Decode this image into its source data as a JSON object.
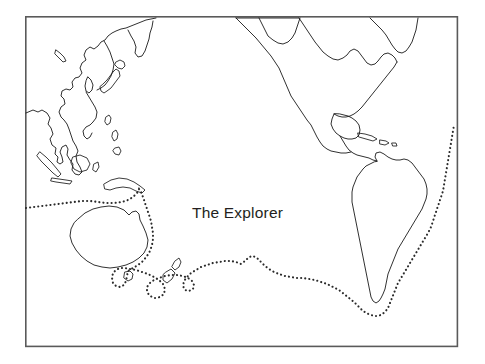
{
  "figure": {
    "name": "pacific-world-map-outline",
    "title": "The Explorer",
    "title_position": {
      "x": 192,
      "y": 218
    },
    "background_color": "#ffffff",
    "border_color": "#5a5a5a",
    "coastline_color": "#1a1a1a",
    "route_color": "#2b2b2b",
    "frame": {
      "x": 25,
      "y": 16,
      "width": 433,
      "height": 331
    },
    "canvas": {
      "width": 485,
      "height": 364
    }
  },
  "map": {
    "projection_note": "Pacific-centred world outline",
    "landmasses": [
      {
        "name": "north-america",
        "label": "North America"
      },
      {
        "name": "south-america",
        "label": "South America"
      },
      {
        "name": "asia-east",
        "label": "East Asia"
      },
      {
        "name": "japan",
        "label": "Japan"
      },
      {
        "name": "kamchatka",
        "label": "Kamchatka"
      },
      {
        "name": "indonesia",
        "label": "Indonesia"
      },
      {
        "name": "philippines",
        "label": "Philippines"
      },
      {
        "name": "new-guinea",
        "label": "New Guinea"
      },
      {
        "name": "australia",
        "label": "Australia"
      },
      {
        "name": "tasmania",
        "label": "Tasmania"
      },
      {
        "name": "new-zealand",
        "label": "New Zealand"
      },
      {
        "name": "caribbean-islands",
        "label": "Caribbean Islands"
      },
      {
        "name": "hawaii",
        "label": "Hawaii"
      }
    ],
    "route": {
      "name": "explorer-voyage-route",
      "style": "dotted",
      "description": "Dotted voyage track entering at the west edge, rounding Australia, looping New Zealand, crossing the South Pacific, rounding Cape Horn and running north along the east coast of South America to the east edge"
    }
  },
  "legend": {
    "route_label": "The Explorer"
  }
}
